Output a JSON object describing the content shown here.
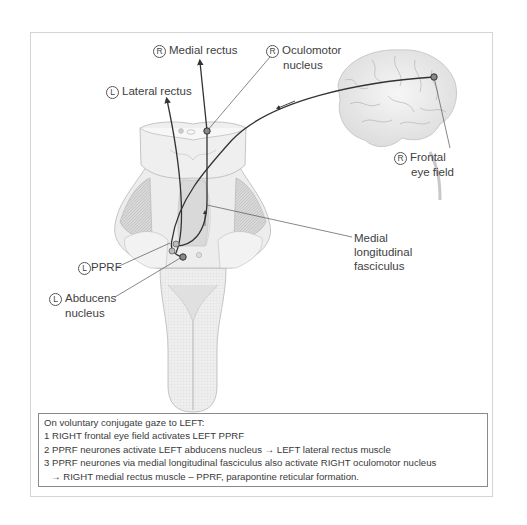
{
  "diagram": {
    "labels": {
      "medial_rectus": {
        "side": "R",
        "text": "Medial rectus"
      },
      "oculomotor": {
        "side": "R",
        "line1": "Oculomotor",
        "line2": "nucleus"
      },
      "lateral_rectus": {
        "side": "L",
        "text": "Lateral rectus"
      },
      "frontal_eye_field": {
        "side": "R",
        "line1": "Frontal",
        "line2": "eye field"
      },
      "mlf": {
        "line1": "Medial",
        "line2": "longitudinal",
        "line3": "fasciculus"
      },
      "pprf": {
        "side": "L",
        "text": "PPRF"
      },
      "abducens": {
        "side": "L",
        "line1": "Abducens",
        "line2": "nucleus"
      }
    },
    "caption": {
      "heading": "On voluntary conjugate gaze to LEFT:",
      "steps": [
        "1 RIGHT frontal eye field activates LEFT PPRF",
        "2 PPRF neurones activate LEFT abducens nucleus → LEFT lateral rectus muscle",
        "3 PPRF neurones via medial longitudinal fasciculus also activate RIGHT oculomotor nucleus"
      ],
      "continuation": "→ RIGHT medial rectus muscle – PPRF, parapontine reticular formation."
    },
    "colors": {
      "frame_border": "#d4d4d4",
      "caption_border": "#8a8a8a",
      "pathway": "#3a3a3a",
      "tissue_fill": "#ececec",
      "tissue_dark": "#d2d2d2"
    }
  }
}
